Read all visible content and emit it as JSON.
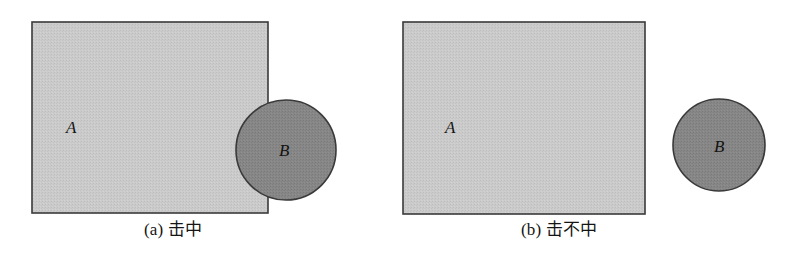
{
  "figure": {
    "type": "diagram",
    "background_color": "#ffffff",
    "width": 792,
    "height": 261
  },
  "style": {
    "rect_fill": "#c9c9c9",
    "circle_fill": "#858585",
    "stroke": "#3a3a3a",
    "label_color": "#141414",
    "caption_color": "#151515"
  },
  "panels": [
    {
      "id": "a",
      "caption": "(a) 击中",
      "caption_x": 144,
      "caption_y": 220,
      "rect": {
        "label": "A",
        "x": 32,
        "y": 22,
        "width": 236,
        "height": 191,
        "label_x": 66,
        "label_y": 133
      },
      "circle": {
        "label": "B",
        "cx": 286,
        "cy": 150,
        "r": 50,
        "label_x": 279,
        "label_y": 156
      },
      "relation": "intersecting"
    },
    {
      "id": "b",
      "caption": "(b) 击不中",
      "caption_x": 521,
      "caption_y": 220,
      "rect": {
        "label": "A",
        "x": 403,
        "y": 22,
        "width": 242,
        "height": 192,
        "label_x": 445,
        "label_y": 133
      },
      "circle": {
        "label": "B",
        "cx": 719,
        "cy": 145,
        "r": 46,
        "label_x": 714,
        "label_y": 152
      },
      "relation": "disjoint"
    }
  ]
}
